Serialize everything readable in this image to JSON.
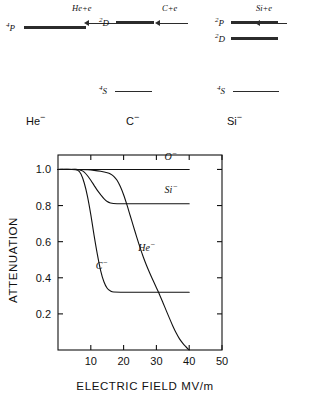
{
  "figure": {
    "level_diagram": {
      "groups": [
        {
          "species": "He⁻",
          "species_label": "He",
          "species_charge": "−",
          "escape_label": "He+e",
          "arrow_name": "detachment-arrow-he",
          "levels": [
            {
              "term_sup": "4",
              "term_letter": "P",
              "style": "thick",
              "name": "level-he-4p"
            }
          ]
        },
        {
          "species": "C⁻",
          "species_label": "C",
          "species_charge": "−",
          "escape_label": "C+e",
          "arrow_name": "detachment-arrow-c",
          "levels": [
            {
              "term_sup": "2",
              "term_letter": "D",
              "style": "thick",
              "name": "level-c-2d"
            },
            {
              "term_sup": "4",
              "term_letter": "S",
              "style": "thin",
              "name": "level-c-4s"
            }
          ]
        },
        {
          "species": "Si⁻",
          "species_label": "Si",
          "species_charge": "−",
          "escape_label": "Si+e",
          "arrow_name": "detachment-arrow-si",
          "levels": [
            {
              "term_sup": "2",
              "term_letter": "P",
              "style": "thick",
              "name": "level-si-2p"
            },
            {
              "term_sup": "2",
              "term_letter": "D",
              "style": "thick",
              "name": "level-si-2d"
            },
            {
              "term_sup": "4",
              "term_letter": "S",
              "style": "thin",
              "name": "level-si-4s"
            }
          ]
        }
      ]
    }
  },
  "chart_data": {
    "type": "line",
    "title": "",
    "xlabel": "ELECTRIC FIELD MV/m",
    "ylabel": "ATTENUATION",
    "xlim": [
      0,
      50
    ],
    "ylim": [
      0,
      1.08
    ],
    "xticks": [
      10,
      20,
      30,
      40,
      50
    ],
    "xticklabels": [
      "10",
      "20",
      "30",
      "40",
      "50"
    ],
    "yticks": [
      0.2,
      0.4,
      0.6,
      0.8,
      1.0
    ],
    "yticklabels": [
      "0.2",
      "0.4",
      "0.6",
      "0.8",
      "1.0"
    ],
    "grid": false,
    "legend": "inline-curve-labels",
    "series": [
      {
        "name": "O⁻",
        "label": "O",
        "label_charge": "−",
        "plateau": 1.0,
        "label_x": 32.5,
        "label_y": 1.05,
        "x": [
          0,
          5,
          10,
          15,
          20,
          25,
          30,
          35,
          40
        ],
        "y": [
          1.0,
          1.0,
          1.0,
          1.0,
          1.0,
          1.0,
          1.0,
          1.0,
          1.0
        ]
      },
      {
        "name": "Si⁻",
        "label": "Si",
        "label_charge": "−",
        "plateau": 0.81,
        "label_x": 32.5,
        "label_y": 0.87,
        "x": [
          0,
          4,
          6,
          7,
          8,
          9,
          10,
          11,
          12,
          13,
          14,
          15,
          16,
          18,
          22,
          30,
          40
        ],
        "y": [
          1.0,
          1.0,
          1.0,
          0.995,
          0.985,
          0.965,
          0.94,
          0.912,
          0.884,
          0.86,
          0.838,
          0.822,
          0.814,
          0.81,
          0.81,
          0.81,
          0.81
        ]
      },
      {
        "name": "C⁻",
        "label": "C",
        "label_charge": "−",
        "plateau": 0.32,
        "label_x": 11.5,
        "label_y": 0.45,
        "x": [
          0,
          4,
          6,
          7,
          8,
          9,
          10,
          11,
          12,
          13,
          14,
          15,
          16,
          17,
          20,
          25,
          30,
          35,
          40
        ],
        "y": [
          1.0,
          1.0,
          0.995,
          0.975,
          0.925,
          0.85,
          0.75,
          0.635,
          0.53,
          0.44,
          0.378,
          0.342,
          0.327,
          0.321,
          0.32,
          0.32,
          0.32,
          0.32,
          0.32
        ]
      },
      {
        "name": "He⁻",
        "label": "He",
        "label_charge": "−",
        "plateau": 0.0,
        "label_x": 24.5,
        "label_y": 0.55,
        "x": [
          0,
          6,
          9,
          11,
          13,
          15,
          16,
          17,
          18,
          19,
          20,
          21,
          22,
          23,
          24,
          25,
          26,
          27,
          28,
          29,
          30,
          31,
          32,
          33,
          34,
          35,
          36,
          37,
          38,
          39,
          40
        ],
        "y": [
          1.0,
          1.0,
          0.998,
          0.995,
          0.99,
          0.982,
          0.975,
          0.962,
          0.94,
          0.905,
          0.86,
          0.805,
          0.745,
          0.685,
          0.625,
          0.568,
          0.515,
          0.468,
          0.425,
          0.385,
          0.345,
          0.305,
          0.262,
          0.218,
          0.175,
          0.133,
          0.095,
          0.063,
          0.038,
          0.018,
          0.0
        ]
      }
    ]
  }
}
